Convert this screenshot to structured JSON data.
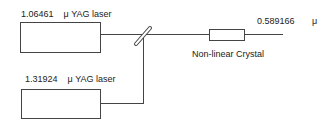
{
  "diagram": {
    "laser1": {
      "wavelength": "1.06461",
      "unit": "μ",
      "name": "YAG laser"
    },
    "laser2": {
      "wavelength": "1.31924",
      "unit": "μ",
      "name": "YAG laser"
    },
    "crystal": {
      "label": "Non-linear Crystal"
    },
    "output": {
      "wavelength": "0.589166",
      "unit": "μ"
    }
  }
}
